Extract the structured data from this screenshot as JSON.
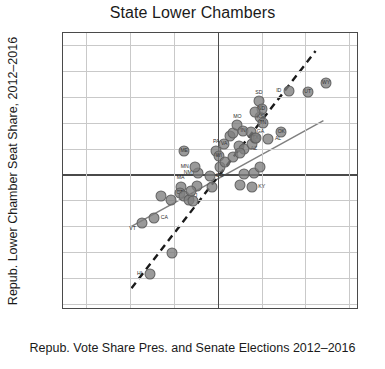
{
  "chart_data": {
    "type": "scatter",
    "title": "State Lower Chambers",
    "xlabel": "Repub. Vote Share Pres. and Senate Elections 2012–2016",
    "ylabel": "Repub. Lower Chamber Seat Share, 2012–2016",
    "xlim": [
      0.148,
      0.822
    ],
    "ylim": [
      -0.022,
      1.045
    ],
    "xticks": [
      ".2",
      ".3",
      ".4",
      ".5",
      ".6",
      ".7",
      ".8"
    ],
    "xtick_values": [
      0.2,
      0.3,
      0.4,
      0.5,
      0.6,
      0.7,
      0.8
    ],
    "yticks": [
      "0",
      ".1",
      ".2",
      ".3",
      ".4",
      ".5",
      ".6",
      ".7",
      ".8",
      ".9",
      "1"
    ],
    "ytick_values": [
      0,
      0.1,
      0.2,
      0.3,
      0.4,
      0.5,
      0.6,
      0.7,
      0.8,
      0.9,
      1.0
    ],
    "grid": true,
    "legend": null,
    "reference_lines": [
      {
        "name": "half-vote-share",
        "axis": "x",
        "value": 0.5
      },
      {
        "name": "half-seat-share",
        "axis": "y",
        "value": 0.5
      }
    ],
    "fit_lines": [
      {
        "name": "solid-regression-line",
        "style": "solid",
        "color": "#808080",
        "x0": 0.302,
        "y0": 0.292,
        "x1": 0.745,
        "y1": 0.705
      },
      {
        "name": "dashed-responsiveness-line",
        "style": "dashed",
        "color": "#1a1a1a",
        "x0": 0.305,
        "y0": 0.055,
        "x1": 0.727,
        "y1": 0.975
      }
    ],
    "points": [
      {
        "label": "HI",
        "x": 0.345,
        "y": 0.118,
        "label_pos": "left"
      },
      {
        "label": "RI",
        "x": 0.396,
        "y": 0.198,
        "label_pos": "none"
      },
      {
        "label": "VT",
        "x": 0.327,
        "y": 0.315,
        "label_pos": "below-left"
      },
      {
        "label": "CA",
        "x": 0.356,
        "y": 0.332,
        "label_pos": "right"
      },
      {
        "label": "MD",
        "x": 0.372,
        "y": 0.418,
        "label_pos": "none"
      },
      {
        "label": "NY",
        "x": 0.394,
        "y": 0.4,
        "label_pos": "none"
      },
      {
        "label": "MA",
        "x": 0.416,
        "y": 0.452,
        "label_pos": "above"
      },
      {
        "label": "CT",
        "x": 0.414,
        "y": 0.43,
        "label_pos": "inside"
      },
      {
        "label": "NJ",
        "x": 0.424,
        "y": 0.418,
        "label_pos": "right"
      },
      {
        "label": "IL",
        "x": 0.436,
        "y": 0.403,
        "label_pos": "none"
      },
      {
        "label": "DE",
        "x": 0.444,
        "y": 0.398,
        "label_pos": "none"
      },
      {
        "label": "NM",
        "x": 0.455,
        "y": 0.505,
        "label_pos": "left"
      },
      {
        "label": "MN",
        "x": 0.448,
        "y": 0.528,
        "label_pos": "left"
      },
      {
        "label": "WA",
        "x": 0.452,
        "y": 0.455,
        "label_pos": "none"
      },
      {
        "label": "OR",
        "x": 0.44,
        "y": 0.435,
        "label_pos": "none"
      },
      {
        "label": "CO",
        "x": 0.482,
        "y": 0.495,
        "label_pos": "right"
      },
      {
        "label": "NV",
        "x": 0.487,
        "y": 0.452,
        "label_pos": "none"
      },
      {
        "label": "ME",
        "x": 0.424,
        "y": 0.592,
        "label_pos": "inside"
      },
      {
        "label": "PA",
        "x": 0.497,
        "y": 0.592,
        "label_pos": "above"
      },
      {
        "label": "WI",
        "x": 0.503,
        "y": 0.572,
        "label_pos": "inside"
      },
      {
        "label": "VA",
        "x": 0.515,
        "y": 0.618,
        "label_pos": "inside"
      },
      {
        "label": "NH",
        "x": 0.506,
        "y": 0.528,
        "label_pos": "none"
      },
      {
        "label": "FL",
        "x": 0.528,
        "y": 0.648,
        "label_pos": "none"
      },
      {
        "label": "OH",
        "x": 0.534,
        "y": 0.66,
        "label_pos": "none"
      },
      {
        "label": "MI",
        "x": 0.516,
        "y": 0.548,
        "label_pos": "none"
      },
      {
        "label": "MT",
        "x": 0.548,
        "y": 0.608,
        "label_pos": "none"
      },
      {
        "label": "AZ",
        "x": 0.56,
        "y": 0.6,
        "label_pos": "right"
      },
      {
        "label": "MO",
        "x": 0.545,
        "y": 0.69,
        "label_pos": "above"
      },
      {
        "label": "IN",
        "x": 0.558,
        "y": 0.668,
        "label_pos": "inside"
      },
      {
        "label": "GA",
        "x": 0.575,
        "y": 0.662,
        "label_pos": "right"
      },
      {
        "label": "IA",
        "x": 0.536,
        "y": 0.568,
        "label_pos": "none"
      },
      {
        "label": "NC",
        "x": 0.552,
        "y": 0.582,
        "label_pos": "none"
      },
      {
        "label": "SC",
        "x": 0.579,
        "y": 0.616,
        "label_pos": "none"
      },
      {
        "label": "TX",
        "x": 0.586,
        "y": 0.64,
        "label_pos": "inside"
      },
      {
        "label": "AL",
        "x": 0.615,
        "y": 0.637,
        "label_pos": "right"
      },
      {
        "label": "MS",
        "x": 0.552,
        "y": 0.46,
        "label_pos": "none"
      },
      {
        "label": "LA",
        "x": 0.56,
        "y": 0.5,
        "label_pos": "none"
      },
      {
        "label": "AR",
        "x": 0.582,
        "y": 0.505,
        "label_pos": "none"
      },
      {
        "label": "KY",
        "x": 0.578,
        "y": 0.452,
        "label_pos": "right"
      },
      {
        "label": "WV",
        "x": 0.596,
        "y": 0.53,
        "label_pos": "none"
      },
      {
        "label": "KS",
        "x": 0.597,
        "y": 0.722,
        "label_pos": "inside"
      },
      {
        "label": "TN",
        "x": 0.603,
        "y": 0.7,
        "label_pos": "inside"
      },
      {
        "label": "SD",
        "x": 0.594,
        "y": 0.782,
        "label_pos": "above"
      },
      {
        "label": "ND",
        "x": 0.6,
        "y": 0.752,
        "label_pos": "inside"
      },
      {
        "label": "NE",
        "x": 0.585,
        "y": 0.742,
        "label_pos": "none"
      },
      {
        "label": "AK",
        "x": 0.588,
        "y": 0.64,
        "label_pos": "none"
      },
      {
        "label": "OK",
        "x": 0.645,
        "y": 0.665,
        "label_pos": "inside"
      },
      {
        "label": "ID",
        "x": 0.662,
        "y": 0.822,
        "label_pos": "left"
      },
      {
        "label": "UT",
        "x": 0.705,
        "y": 0.818,
        "label_pos": "inside"
      },
      {
        "label": "WY",
        "x": 0.747,
        "y": 0.852,
        "label_pos": "inside"
      }
    ]
  }
}
